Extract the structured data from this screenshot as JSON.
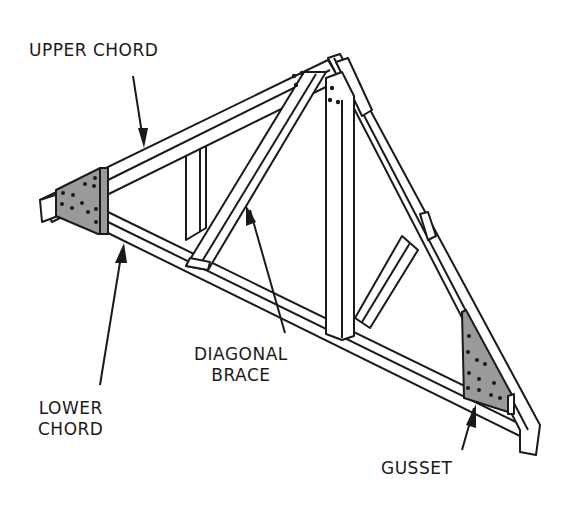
{
  "diagram": {
    "labels": {
      "upper_chord": "UPPER CHORD",
      "diagonal_brace_line1": "DIAGONAL",
      "diagonal_brace_line2": "BRACE",
      "lower_chord_line1": "LOWER",
      "lower_chord_line2": "CHORD",
      "gusset": "GUSSET"
    },
    "colors": {
      "line": "#1a1a1a",
      "gusset_fill": "#9a9a9a",
      "background": "#ffffff"
    }
  }
}
